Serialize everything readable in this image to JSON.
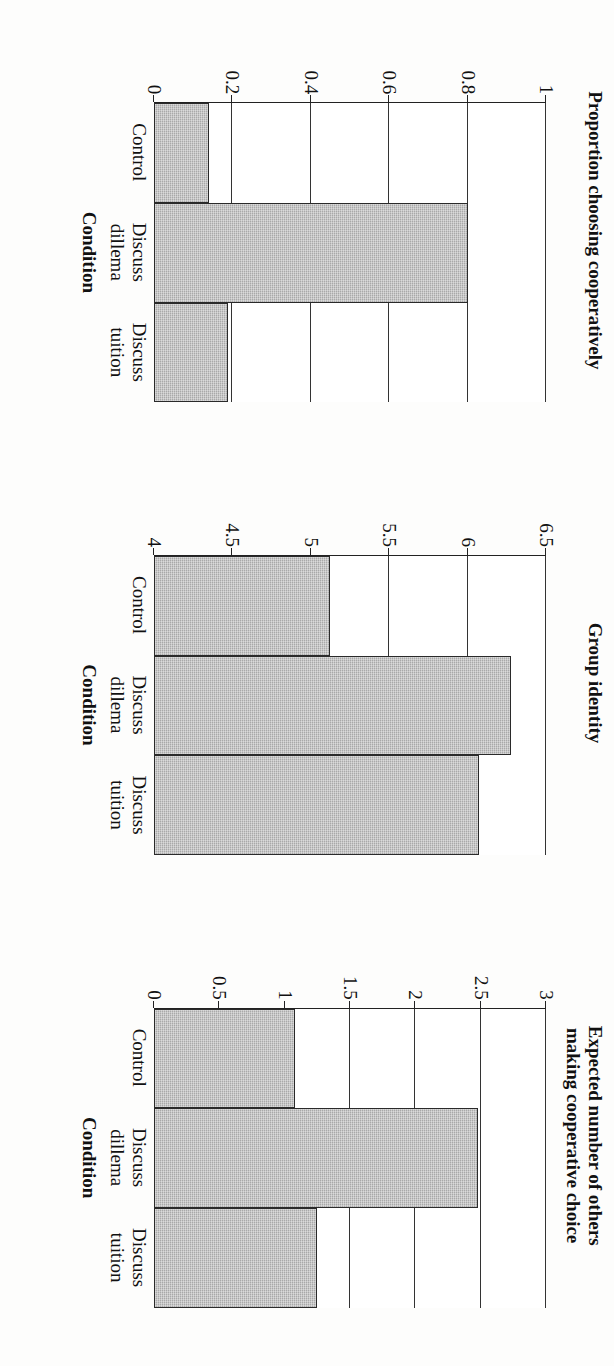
{
  "figure": {
    "orientation_note": "rotated-90-degrees",
    "bar_fill_color": "#a9a9a9",
    "bar_edge_color": "#2a2a2a",
    "axis_color": "#222222"
  },
  "chart_data": [
    {
      "type": "bar",
      "title": "Proportion choosing cooperatively",
      "xlabel": "Condition",
      "ylabel": "",
      "categories": [
        "Control",
        "Discuss\ndillema",
        "Discuss\ntuition"
      ],
      "values": [
        0.14,
        0.8,
        0.19
      ],
      "ylim": [
        0,
        1
      ],
      "yticks": [
        0,
        0.2,
        0.4,
        0.6,
        0.8,
        1
      ],
      "ytick_labels": [
        "0",
        "0.2",
        "0.4",
        "0.6",
        "0.8",
        "1"
      ],
      "grid": true,
      "legend": "none"
    },
    {
      "type": "bar",
      "title": "Group identity",
      "xlabel": "Condition",
      "ylabel": "",
      "categories": [
        "Control",
        "Discuss\ndillema",
        "Discuss\ntuition"
      ],
      "values": [
        5.12,
        6.28,
        6.07
      ],
      "ylim": [
        4,
        6.5
      ],
      "yticks": [
        4,
        4.5,
        5,
        5.5,
        6,
        6.5
      ],
      "ytick_labels": [
        "4",
        "4.5",
        "5",
        "5.5",
        "6",
        "6.5"
      ],
      "grid": true,
      "legend": "none"
    },
    {
      "type": "bar",
      "title": "Expected number of others\nmaking cooperative choice",
      "xlabel": "Condition",
      "ylabel": "",
      "categories": [
        "Control",
        "Discuss\ndillema",
        "Discuss\ntuition"
      ],
      "values": [
        1.08,
        2.48,
        1.25
      ],
      "ylim": [
        0,
        3
      ],
      "yticks": [
        0,
        0.5,
        1,
        1.5,
        2,
        2.5,
        3
      ],
      "ytick_labels": [
        "0",
        "0.5",
        "1",
        "1.5",
        "2",
        "2.5",
        "3"
      ],
      "grid": true,
      "legend": "none"
    }
  ]
}
